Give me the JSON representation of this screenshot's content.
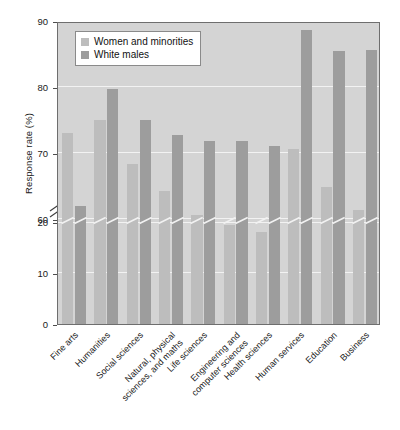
{
  "chart_data": {
    "type": "bar",
    "title": "",
    "xlabel": "",
    "ylabel": "Response rate (%)",
    "ylim": [
      0,
      90
    ],
    "yticks": [
      0,
      10,
      20,
      60,
      70,
      80,
      90
    ],
    "ytick_labels": [
      "0",
      "10",
      "20",
      "60",
      "70",
      "80",
      "90"
    ],
    "axis_break": {
      "present": true,
      "between": [
        20,
        60
      ],
      "style": "double-slash"
    },
    "grid": "horizontal-white-gridlines",
    "legend_position": "upper-left-inside",
    "categories": [
      "Fine arts",
      "Humanities",
      "Social sciences",
      "Natural, physical\nsciences, and maths",
      "Life sciences",
      "Engineering and\ncomputer sciences",
      "Health sciences",
      "Human services",
      "Education",
      "Business"
    ],
    "series": [
      {
        "name": "Women and minorities",
        "color": "#bdbdbd",
        "values": [
          73.0,
          75.0,
          68.3,
          64.2,
          60.6,
          59.0,
          58.0,
          70.6,
          64.8,
          61.3
        ]
      },
      {
        "name": "White males",
        "color": "#9d9d9d",
        "values": [
          62.0,
          79.7,
          75.0,
          72.7,
          71.8,
          71.8,
          71.0,
          88.7,
          85.4,
          85.6
        ]
      }
    ]
  },
  "legend": {
    "items": [
      {
        "label": "Women and minorities",
        "color": "#bdbdbd"
      },
      {
        "label": "White males",
        "color": "#9d9d9d"
      }
    ]
  },
  "axis": {
    "y_title": "Response rate (%)"
  }
}
